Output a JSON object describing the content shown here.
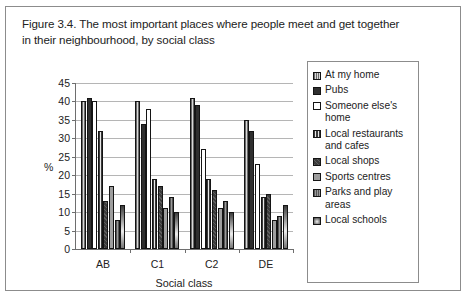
{
  "figure": {
    "caption_line1": "Figure 3.4. The most important places where people meet and get together",
    "caption_line2": "in their neighbourhood, by social class"
  },
  "chart_data": {
    "type": "bar",
    "title": "Figure 3.4. The most important places where people meet and get together in their neighbourhood, by social class",
    "xlabel": "Social class",
    "ylabel": "%",
    "ylim": [
      0,
      45
    ],
    "yticks": [
      0,
      5,
      10,
      15,
      20,
      25,
      30,
      35,
      40,
      45
    ],
    "grid": true,
    "legend_position": "right",
    "categories": [
      "AB",
      "C1",
      "C2",
      "DE"
    ],
    "series": [
      {
        "name": "At my home",
        "values": [
          40,
          40,
          41,
          35
        ],
        "swatch": "s0"
      },
      {
        "name": "Pubs",
        "values": [
          41,
          34,
          39,
          32
        ],
        "swatch": "s1"
      },
      {
        "name": "Someone else's home",
        "values": [
          40,
          38,
          27,
          23
        ],
        "swatch": "s2"
      },
      {
        "name": "Local restaurants and cafes",
        "values": [
          32,
          19,
          19,
          14
        ],
        "swatch": "s3"
      },
      {
        "name": "Local shops",
        "values": [
          13,
          17,
          16,
          15
        ],
        "swatch": "s4"
      },
      {
        "name": "Sports centres",
        "values": [
          17,
          11,
          11,
          8
        ],
        "swatch": "s5"
      },
      {
        "name": "Parks and play areas",
        "values": [
          8,
          14,
          13,
          9
        ],
        "swatch": "s6"
      },
      {
        "name": "Local schools",
        "values": [
          12,
          10,
          10,
          12
        ],
        "swatch": "s7"
      }
    ]
  }
}
